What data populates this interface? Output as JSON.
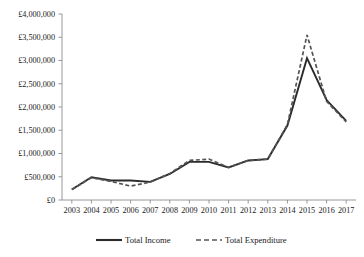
{
  "chart_data": {
    "type": "line",
    "title": "",
    "subtitle": "",
    "xlabel": "",
    "ylabel": "",
    "categories": [
      "2003",
      "2004",
      "2005",
      "2006",
      "2007",
      "2008",
      "2009",
      "2010",
      "2011",
      "2012",
      "2013",
      "2014",
      "2015",
      "2016",
      "2017"
    ],
    "series": [
      {
        "name": "Total Income",
        "style": "solid",
        "color": "#2b2b2b",
        "values": [
          225000,
          490000,
          420000,
          420000,
          390000,
          560000,
          820000,
          820000,
          700000,
          850000,
          880000,
          1600000,
          3050000,
          2150000,
          1700000
        ]
      },
      {
        "name": "Total Expenditure",
        "style": "dashed",
        "color": "#555555",
        "values": [
          225000,
          480000,
          400000,
          300000,
          385000,
          570000,
          850000,
          880000,
          700000,
          850000,
          880000,
          1620000,
          3550000,
          2120000,
          1680000
        ]
      }
    ],
    "ylim": [
      0,
      4000000
    ],
    "ytick_values": [
      0,
      500000,
      1000000,
      1500000,
      2000000,
      2500000,
      3000000,
      3500000,
      4000000
    ],
    "ytick_labels": [
      "£0",
      "£500,000",
      "£1,000,000",
      "£1,500,000",
      "£2,000,000",
      "£2,500,000",
      "£3,000,000",
      "£3,500,000",
      "£4,000,000"
    ],
    "grid": false,
    "legend_position": "bottom",
    "legend_entries": [
      {
        "label": "Total Income",
        "style": "solid"
      },
      {
        "label": "Total Expenditure",
        "style": "dashed"
      }
    ],
    "currency_symbol": "£"
  }
}
